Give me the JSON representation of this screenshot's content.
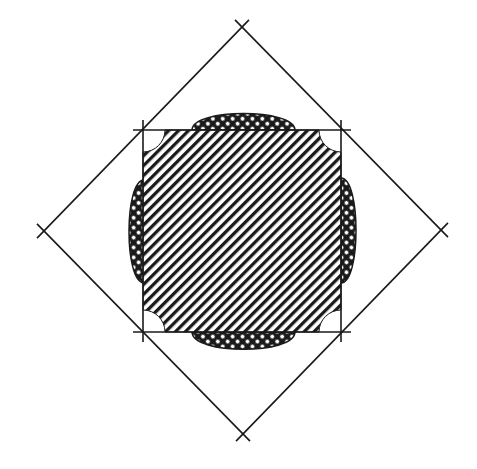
{
  "figure": {
    "background": "#ffffff",
    "stroke_color": "#1a1a1a",
    "diamond": {
      "top": [
        242,
        27
      ],
      "right": [
        441,
        230
      ],
      "bottom": [
        243,
        434
      ],
      "left": [
        44,
        231
      ]
    },
    "square": {
      "top_left": [
        143,
        130
      ],
      "top_right": [
        341,
        129
      ],
      "bottom_right": [
        341,
        332
      ],
      "bottom_left": [
        144,
        332
      ],
      "fill_pattern": "diagonal-hatch",
      "corner_cutout_radius": 22
    },
    "lobes": {
      "pattern": "cross-hatch",
      "top": {
        "x1": 192,
        "x2": 295,
        "edge": 130,
        "extent": 111
      },
      "bottom": {
        "x1": 192,
        "x2": 295,
        "edge": 332,
        "extent": 352
      },
      "left": {
        "y1": 180,
        "y2": 283,
        "edge": 144,
        "extent": 127
      },
      "right": {
        "y1": 178,
        "y2": 283,
        "edge": 341,
        "extent": 358
      }
    }
  }
}
